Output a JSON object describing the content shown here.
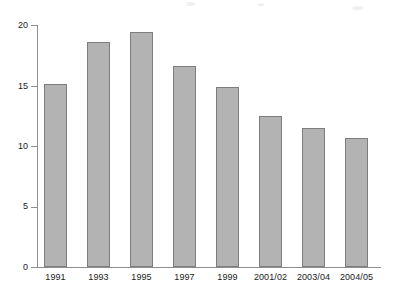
{
  "chart_data": {
    "type": "bar",
    "title": "",
    "subtitle": "",
    "xlabel": "",
    "ylabel": "",
    "categories": [
      "1991",
      "1993",
      "1995",
      "1997",
      "1999",
      "2001/02",
      "2003/04",
      "2004/05"
    ],
    "values": [
      15.1,
      18.6,
      19.4,
      16.6,
      14.9,
      12.5,
      11.5,
      10.7
    ],
    "series": [
      {
        "name": "",
        "values": [
          15.1,
          18.6,
          19.4,
          16.6,
          14.9,
          12.5,
          11.5,
          10.7
        ]
      }
    ],
    "ylim": [
      0,
      20
    ],
    "xlim": null,
    "ytick_labels": [
      "0",
      "5",
      "10",
      "15",
      "20"
    ],
    "ytick_values": [
      0,
      5,
      10,
      15,
      20
    ],
    "grid": false,
    "legend": null,
    "legend_position": "none",
    "annotations": [],
    "bar_color": "#b3b3b3",
    "bar_edge_color": "#7d7d7d",
    "axis_color": "#8e8e8e",
    "background_color": "#ffffff",
    "text_color": "#1a1a1a"
  }
}
